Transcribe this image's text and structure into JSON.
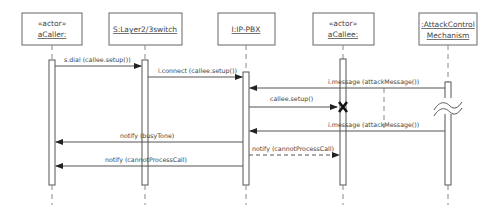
{
  "diagram": {
    "type": "UML sequence diagram",
    "participants": [
      {
        "id": "caller",
        "stereotype": "«actor»",
        "name": "aCaller:",
        "x": 52
      },
      {
        "id": "switch",
        "stereotype": "",
        "name": "S:Layer2/3switch",
        "x": 145
      },
      {
        "id": "pbx",
        "stereotype": "",
        "name": "I:IP-PBX",
        "x": 246
      },
      {
        "id": "callee",
        "stereotype": "«actor»",
        "name": "aCallee:",
        "x": 343
      },
      {
        "id": "attack",
        "stereotype": "",
        "name_line1": ":AttackControl",
        "name_line2": "Mechanism",
        "x": 448
      }
    ],
    "messages": [
      {
        "id": "m1",
        "label": "s.dial (callee.setup())",
        "from": "caller",
        "to": "switch",
        "style": "solid"
      },
      {
        "id": "m2",
        "label": "i.connect (callee.setup())",
        "from": "switch",
        "to": "pbx",
        "style": "solid"
      },
      {
        "id": "m3",
        "label": "i.message (attackMessage())",
        "from": "attack",
        "to": "pbx",
        "style": "solid"
      },
      {
        "id": "m4",
        "label": "callee.setup()",
        "from": "pbx",
        "to": "callee",
        "style": "solid",
        "terminates": true
      },
      {
        "id": "m5",
        "label": "i.message (attackMessage())",
        "from": "attack",
        "to": "pbx",
        "style": "solid"
      },
      {
        "id": "m6",
        "label": "notify (busyTone)",
        "from": "pbx",
        "to": "caller",
        "style": "solid"
      },
      {
        "id": "m7",
        "label": "notify (cannotProcessCall)",
        "from": "pbx",
        "to": "callee",
        "style": "dashed"
      },
      {
        "id": "m8",
        "label": "notify (cannotProcessCall)",
        "from": "pbx",
        "to": "caller",
        "style": "solid"
      }
    ],
    "annotations": {
      "destruction_marker": "X",
      "time_break": "≈"
    }
  }
}
